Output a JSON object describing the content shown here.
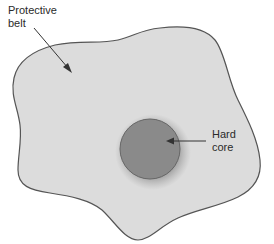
{
  "diagram": {
    "belt": {
      "label_line1": "Protective",
      "label_line2": "belt",
      "fill": "#dcdcdc",
      "stroke": "#555555"
    },
    "core": {
      "label_line1": "Hard",
      "label_line2": "core",
      "fill": "#8a8a8a",
      "stroke": "#666666"
    }
  }
}
